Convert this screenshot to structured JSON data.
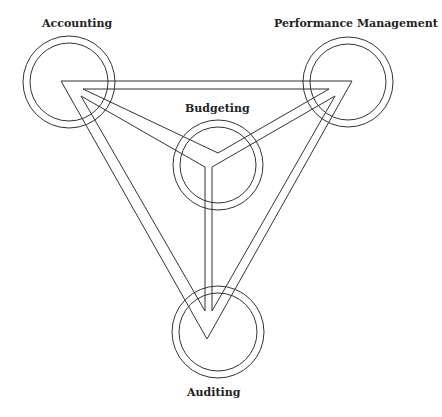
{
  "diagram": {
    "type": "triangle-network",
    "nodes": [
      {
        "id": "accounting",
        "label": "Accounting",
        "position": "top-left"
      },
      {
        "id": "performance",
        "label": "Performance Management",
        "position": "top-right"
      },
      {
        "id": "budgeting",
        "label": "Budgeting",
        "position": "center"
      },
      {
        "id": "auditing",
        "label": "Auditing",
        "position": "bottom"
      }
    ],
    "edges": [
      [
        "accounting",
        "performance"
      ],
      [
        "performance",
        "auditing"
      ],
      [
        "auditing",
        "accounting"
      ],
      [
        "budgeting",
        "accounting"
      ],
      [
        "budgeting",
        "performance"
      ],
      [
        "budgeting",
        "auditing"
      ]
    ],
    "colors": {
      "line": "#333333",
      "text": "#222222",
      "background": "#ffffff"
    }
  }
}
